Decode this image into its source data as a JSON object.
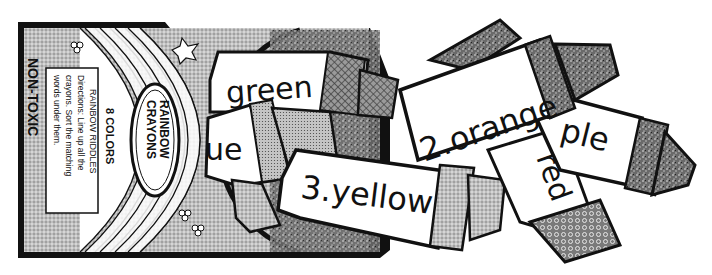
{
  "worksheet": {
    "box": {
      "brand_label_line1": "RAINBOW",
      "brand_label_line2": "CRAYONS",
      "count_label": "8 COLORS",
      "side_label": "NON-TOXIC",
      "panel_title": "RAINBOW RIDDLES",
      "directions_line1": "Directions: Line up all the",
      "directions_line2": "crayons. Sort the matching",
      "directions_line3": "words under them."
    },
    "crayons": [
      {
        "id": "green",
        "label": "green"
      },
      {
        "id": "blue",
        "label": "ue"
      },
      {
        "id": "yellow",
        "label": "3.yellow"
      },
      {
        "id": "orange",
        "label": "2.orange"
      },
      {
        "id": "purple",
        "label": "ple"
      },
      {
        "id": "red",
        "label": "red"
      }
    ],
    "colors": {
      "outline": "#111111",
      "paper": "#ffffff",
      "box_fill": "#c8c8c8",
      "dark_tip": "#555555",
      "mid_tip": "#8a8a8a",
      "light_tip": "#b5b5b5"
    }
  }
}
